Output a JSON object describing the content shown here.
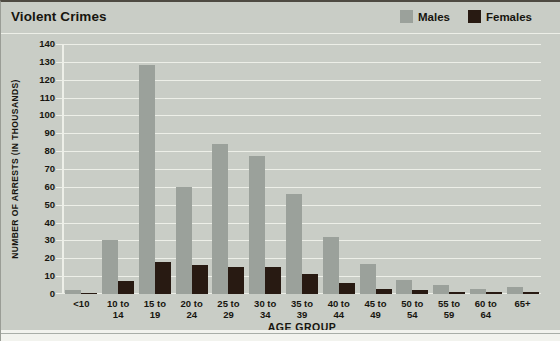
{
  "title": "Violent Crimes",
  "colors": {
    "background": "#c9cdc6",
    "gridline": "#edefe8",
    "males_bar": "#9ba19b",
    "females_bar": "#281a12",
    "text": "#17150f"
  },
  "chart_data": {
    "type": "bar",
    "title": "Violent Crimes",
    "xlabel": "AGE GROUP",
    "ylabel": "NUMBER OF ARRESTS (IN THOUSANDS)",
    "ylim": [
      0,
      140
    ],
    "ytick_step": 10,
    "grid": true,
    "legend_position": "top-right",
    "categories": [
      "<10",
      "10 to 14",
      "15 to 19",
      "20 to 24",
      "25 to 29",
      "30 to 34",
      "35 to 39",
      "40 to 44",
      "45 to 49",
      "50 to 54",
      "55 to 59",
      "60 to 64",
      "65+"
    ],
    "series": [
      {
        "name": "Males",
        "color": "#9ba19b",
        "values": [
          2,
          30,
          128,
          60,
          84,
          77,
          56,
          32,
          17,
          8,
          5,
          3,
          4
        ]
      },
      {
        "name": "Females",
        "color": "#281a12",
        "values": [
          0.5,
          7,
          18,
          16,
          15,
          15,
          11,
          6,
          3,
          2,
          1,
          1,
          1
        ]
      }
    ]
  }
}
